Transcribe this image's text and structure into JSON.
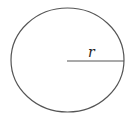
{
  "diagram": {
    "type": "circle-with-radius",
    "radius_label": "r",
    "colors": {
      "stroke": "#555555",
      "label": "#222222",
      "background": "#ffffff"
    },
    "circle": {
      "cx": 67.5,
      "cy": 60,
      "rx": 56.5,
      "ry": 52
    },
    "radius_line": {
      "x1": 67,
      "y1": 61,
      "x2": 124,
      "y2": 61
    }
  }
}
